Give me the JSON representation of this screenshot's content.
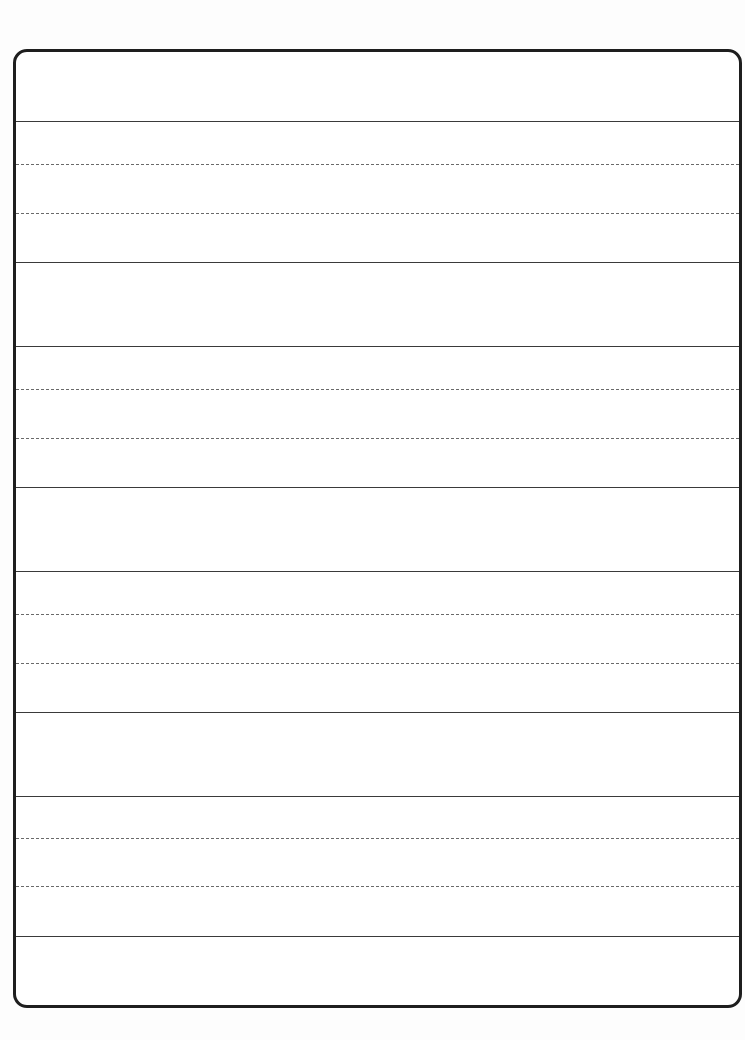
{
  "sheet": {
    "type": "handwriting practice sheet",
    "border_color": "#1e1e1e",
    "line_color": "#3a3a3a",
    "guide_color": "#6a6a6a",
    "lines": [
      {
        "y": 69,
        "style": "solid"
      },
      {
        "y": 112,
        "style": "dashed"
      },
      {
        "y": 161,
        "style": "dashed"
      },
      {
        "y": 210,
        "style": "solid"
      },
      {
        "y": 294,
        "style": "solid"
      },
      {
        "y": 337,
        "style": "dashed"
      },
      {
        "y": 386,
        "style": "dashed"
      },
      {
        "y": 435,
        "style": "solid"
      },
      {
        "y": 519,
        "style": "solid"
      },
      {
        "y": 562,
        "style": "dashed"
      },
      {
        "y": 611,
        "style": "dashed"
      },
      {
        "y": 660,
        "style": "solid"
      },
      {
        "y": 744,
        "style": "solid"
      },
      {
        "y": 786,
        "style": "dashed"
      },
      {
        "y": 834,
        "style": "dashed"
      },
      {
        "y": 884,
        "style": "solid"
      }
    ]
  }
}
